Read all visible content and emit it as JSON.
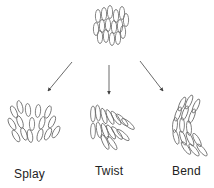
{
  "diagram": {
    "type": "liquid-crystal-deformations",
    "nodes": [
      {
        "id": "aligned",
        "label": ""
      },
      {
        "id": "splay",
        "label": "Splay"
      },
      {
        "id": "twist",
        "label": "Twist"
      },
      {
        "id": "bend",
        "label": "Bend"
      }
    ],
    "edges": [
      {
        "from": "aligned",
        "to": "splay"
      },
      {
        "from": "aligned",
        "to": "twist"
      },
      {
        "from": "aligned",
        "to": "bend"
      }
    ],
    "colors": {
      "stroke": "#555555",
      "arrow": "#444444",
      "text": "#222222"
    }
  },
  "labels": {
    "splay": "Splay",
    "twist": "Twist",
    "bend": "Bend"
  }
}
